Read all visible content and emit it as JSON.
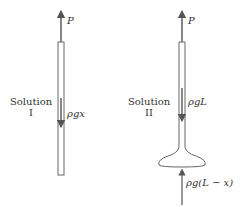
{
  "solution_1": {
    "label_line1": "Solution",
    "label_line2": "I",
    "top_force": "P",
    "internal_force": "ρgx"
  },
  "solution_2": {
    "label_line1": "Solution",
    "label_line2": "II",
    "top_force": "P",
    "internal_force": "ρgL",
    "bottom_force": "ρg(L − x)"
  },
  "colors": {
    "stroke": "#555555",
    "text": "#333333"
  }
}
